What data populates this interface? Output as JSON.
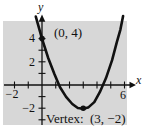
{
  "figure": {
    "background": "#ffffff",
    "plot_bg": "#d7d7d7",
    "axis_color": "#111111",
    "curve_color": "#111111",
    "x_axis_label": "x",
    "y_axis_label": "y",
    "ticks": {
      "y_4": "4",
      "y_2": "2",
      "y_neg2": "−2",
      "x_neg2": "−2",
      "x_6": "6"
    }
  },
  "chart_data": {
    "type": "line",
    "title": "",
    "xlabel": "x",
    "ylabel": "y",
    "xlim": [
      -2.8,
      6.8
    ],
    "ylim": [
      -3.5,
      6.0
    ],
    "grid": false,
    "x_ticks": [
      -2,
      -1,
      1,
      2,
      3,
      4,
      5,
      6
    ],
    "y_ticks": [
      -3,
      -2,
      -1,
      1,
      2,
      3,
      4
    ],
    "x_tick_labels_shown": [
      "−2",
      "6"
    ],
    "y_tick_labels_shown": [
      "4",
      "2",
      "−2"
    ],
    "series": [
      {
        "name": "upward parabola through (0, 4) with vertex (3, −2)",
        "x": [
          -0.45,
          0,
          0.45,
          0.9,
          1.3,
          1.75,
          2.2,
          2.6,
          3,
          3.35,
          3.8,
          4.2,
          4.65,
          5.1,
          5.45,
          5.7,
          5.9
        ],
        "y": [
          5.9,
          4,
          2.33,
          0.95,
          -0.17,
          -1.03,
          -1.64,
          -1.98,
          -2.05,
          -1.95,
          -1.47,
          -0.62,
          0.58,
          2.14,
          3.72,
          4.78,
          5.95
        ]
      }
    ],
    "points": [
      {
        "x": 0,
        "y": 4,
        "label": "(0, 4)"
      },
      {
        "x": 3,
        "y": -2,
        "label": "Vertex:  (3, −2)"
      }
    ]
  }
}
